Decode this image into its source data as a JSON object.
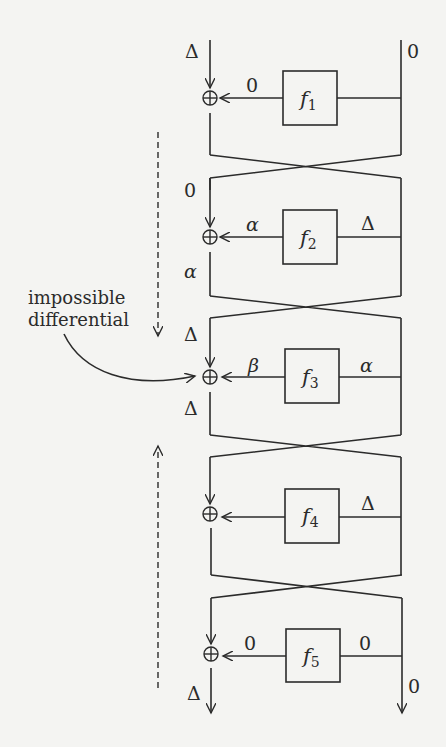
{
  "diagram": {
    "annotation": {
      "line1": "impossible",
      "line2": "differential"
    },
    "rounds": [
      {
        "func": "f",
        "sub": "1",
        "left_in": "Δ",
        "f_out": "0",
        "f_in": "",
        "right_in": "0",
        "left_out": ""
      },
      {
        "func": "f",
        "sub": "2",
        "left_in": "0",
        "f_out": "α",
        "f_in": "Δ",
        "right_in": "",
        "left_out": "α"
      },
      {
        "func": "f",
        "sub": "3",
        "left_in": "Δ",
        "f_out": "β",
        "f_in": "α",
        "right_in": "",
        "left_out": "Δ"
      },
      {
        "func": "f",
        "sub": "4",
        "left_in": "",
        "f_out": "",
        "f_in": "Δ",
        "right_in": "",
        "left_out": ""
      },
      {
        "func": "f",
        "sub": "5",
        "left_in": "",
        "f_out": "0",
        "f_in": "0",
        "right_in": "",
        "left_out": "Δ"
      }
    ],
    "outputs": {
      "left": "Δ",
      "right": "0"
    },
    "xor_symbol": "⊕",
    "colors": {
      "ink": "#2b2b2b",
      "paper": "#f4f4f2"
    }
  }
}
